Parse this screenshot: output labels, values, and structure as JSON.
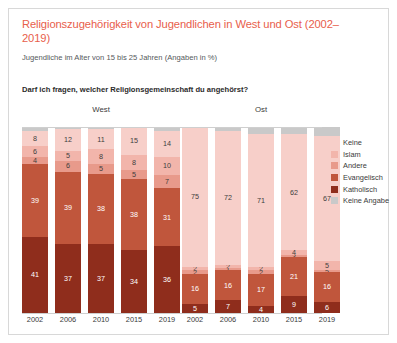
{
  "header": {
    "title": "Religionszugehörigkeit von Jugendlichen in West und Ost (2002–2019)",
    "subtitle": "Jugendliche im Alter von 15 bis 25 Jahren (Angaben in %)",
    "question": "Darf ich fragen, welcher Religionsgemeinschaft du angehörst?"
  },
  "groups": [
    {
      "label": "West"
    },
    {
      "label": "Ost"
    }
  ],
  "legend": {
    "position": "right",
    "items": [
      {
        "label": "Keine",
        "color": "#f7cfc9"
      },
      {
        "label": "Islam",
        "color": "#f2b5ab"
      },
      {
        "label": "Andere",
        "color": "#e89a8b"
      },
      {
        "label": "Evangelisch",
        "color": "#c0563c"
      },
      {
        "label": "Katholisch",
        "color": "#8f2d1c"
      },
      {
        "label": "Keine Angabe",
        "color": "#c9c9c9"
      }
    ]
  },
  "chart_data": {
    "type": "bar",
    "title": "Religionszugehörigkeit von Jugendlichen in West und Ost (2002–2019)",
    "subtitle": "Jugendliche im Alter von 15 bis 25 Jahren (Angaben in %)",
    "xlabel": "",
    "ylabel": "Anteil in %",
    "ylim": [
      0,
      100
    ],
    "grid": false,
    "stacked": true,
    "legend_position": "right",
    "categories": [
      "2002",
      "2006",
      "2010",
      "2015",
      "2019"
    ],
    "groups": [
      "West",
      "Ost"
    ],
    "series": [
      {
        "name": "Katholisch",
        "color": "#8f2d1c",
        "West": [
          41,
          37,
          37,
          34,
          36
        ],
        "Ost": [
          5,
          7,
          4,
          9,
          6
        ]
      },
      {
        "name": "Evangelisch",
        "color": "#c0563c",
        "West": [
          39,
          39,
          38,
          38,
          31
        ],
        "Ost": [
          16,
          16,
          17,
          21,
          16
        ]
      },
      {
        "name": "Andere",
        "color": "#e89a8b",
        "West": [
          4,
          6,
          5,
          5,
          7
        ],
        "Ost": [
          2,
          1,
          2,
          1,
          1
        ]
      },
      {
        "name": "Islam",
        "color": "#f2b5ab",
        "West": [
          6,
          5,
          8,
          8,
          10
        ],
        "Ost": [
          2,
          2,
          2,
          3,
          5
        ]
      },
      {
        "name": "Keine",
        "color": "#f7cfc9",
        "West": [
          8,
          12,
          11,
          15,
          14
        ],
        "Ost": [
          75,
          72,
          71,
          62,
          67
        ]
      },
      {
        "name": "Keine Angabe",
        "color": "#c9c9c9",
        "West": [
          2,
          1,
          1,
          0,
          2
        ],
        "Ost": [
          0,
          2,
          4,
          4,
          5
        ]
      }
    ],
    "labels_shown": {
      "West": {
        "2002": {
          "Katholisch": "41",
          "Evangelisch": "39",
          "Andere": "4",
          "Islam": "6",
          "Keine": "8"
        },
        "2006": {
          "Katholisch": "37",
          "Evangelisch": "39",
          "Andere": "6",
          "Islam": "5",
          "Keine": "12"
        },
        "2010": {
          "Katholisch": "37",
          "Evangelisch": "38",
          "Andere": "5",
          "Islam": "8",
          "Keine": "11"
        },
        "2015": {
          "Katholisch": "34",
          "Evangelisch": "38",
          "Andere": "5",
          "Islam": "8",
          "Keine": "15"
        },
        "2019": {
          "Katholisch": "36",
          "Evangelisch": "31",
          "Andere": "7",
          "Islam": "10",
          "Keine": "14"
        }
      },
      "Ost": {
        "2002": {
          "Katholisch": "5",
          "Evangelisch": "16",
          "Andere": "2",
          "Islam": "2",
          "Keine": "75"
        },
        "2006": {
          "Katholisch": "7",
          "Evangelisch": "16",
          "Andere": "1",
          "Islam": "2",
          "Keine": "72"
        },
        "2010": {
          "Katholisch": "4",
          "Evangelisch": "17",
          "Andere": "2",
          "Islam": "2",
          "Keine": "71"
        },
        "2015": {
          "Katholisch": "9",
          "Evangelisch": "21",
          "Andere": "3",
          "Islam": "4",
          "Keine": "62"
        },
        "2019": {
          "Katholisch": "6",
          "Evangelisch": "16",
          "Andere": "5",
          "Islam": "5",
          "Keine": "67"
        }
      }
    }
  }
}
